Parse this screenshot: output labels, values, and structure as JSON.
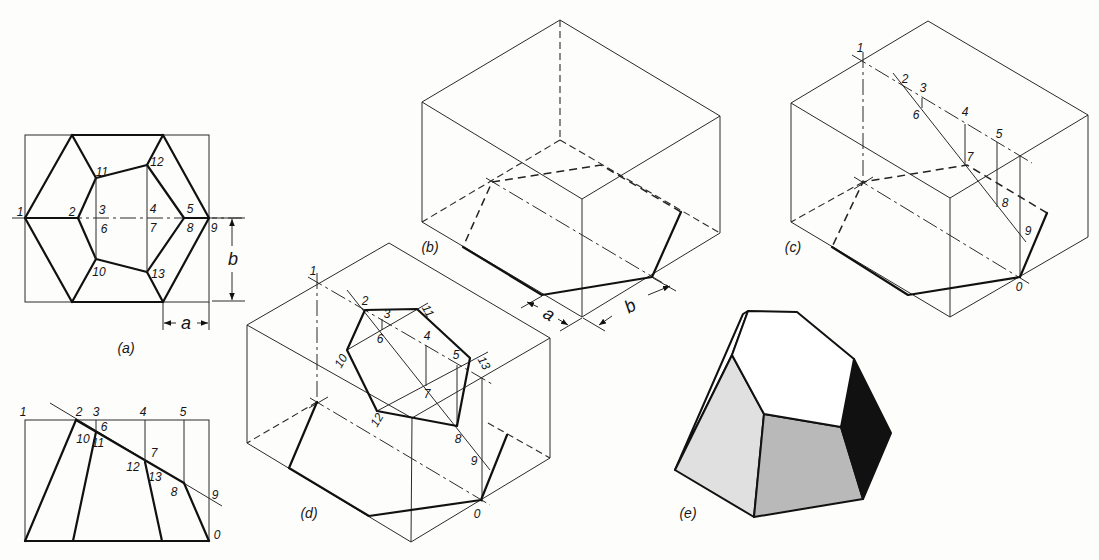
{
  "top_view": {
    "caption": "(a)",
    "labels": [
      "1",
      "2",
      "3",
      "4",
      "5",
      "6",
      "7",
      "8",
      "9",
      "10",
      "11",
      "12",
      "13"
    ],
    "dimension_a": "a",
    "dimension_b": "b"
  },
  "front_view": {
    "labels": [
      "1",
      "2",
      "3",
      "4",
      "5",
      "6",
      "7",
      "8",
      "9",
      "10",
      "11",
      "12",
      "13",
      "0"
    ]
  },
  "figure_b": {
    "caption": "(b)",
    "dimension_a": "a",
    "dimension_b": "b"
  },
  "figure_c": {
    "caption": "(c)",
    "labels": [
      "1",
      "2",
      "3",
      "4",
      "5",
      "6",
      "7",
      "8",
      "9",
      "0"
    ]
  },
  "figure_d": {
    "caption": "(d)",
    "labels": [
      "1",
      "2",
      "3",
      "4",
      "5",
      "6",
      "7",
      "8",
      "9",
      "10",
      "11",
      "12",
      "13",
      "0"
    ]
  },
  "figure_e": {
    "caption": "(e)",
    "face_colors": {
      "top": "#ffffff",
      "left": "#e0e0e0",
      "front": "#b9b9b9",
      "right": "#111111"
    }
  }
}
